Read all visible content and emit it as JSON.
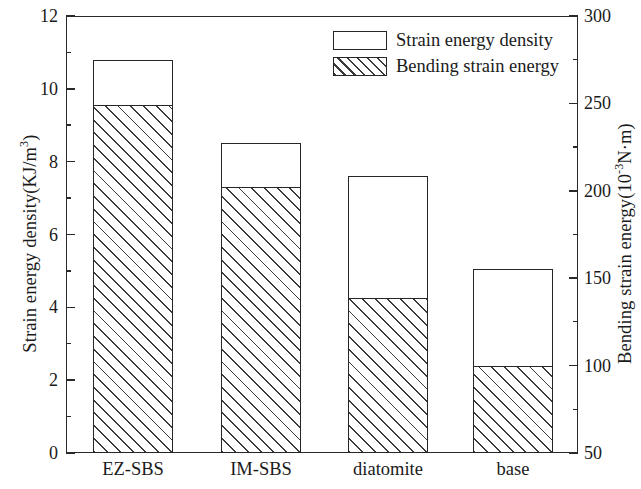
{
  "chart_data": {
    "type": "bar",
    "title": "",
    "subtitle": "",
    "stacked": true,
    "categories": [
      "EZ-SBS",
      "IM-SBS",
      "diatomite",
      "base"
    ],
    "series": [
      {
        "name": "Strain energy density",
        "axis": "left",
        "pattern": "open",
        "values": [
          10.8,
          8.5,
          7.6,
          5.05
        ]
      },
      {
        "name": "Bending strain energy",
        "axis": "right",
        "pattern": "hatched",
        "values": [
          250,
          200,
          135,
          100
        ],
        "values_left_axis_equivalent": [
          9.55,
          7.3,
          4.25,
          2.4
        ]
      }
    ],
    "xlabel": "",
    "ylabel": "Strain energy density(KJ/m3)",
    "ylabel_right": "Bending strain energy(10-3N·m)",
    "ylim": [
      0,
      12
    ],
    "ylim_right": [
      50,
      300
    ],
    "yticks": [
      0,
      2,
      4,
      6,
      8,
      10,
      12
    ],
    "yticks_minor": [
      1,
      3,
      5,
      7,
      9,
      11
    ],
    "yticks_right": [
      50,
      100,
      150,
      200,
      250,
      300
    ],
    "yticks_right_minor": [
      75,
      125,
      175,
      225,
      275
    ],
    "grid": false,
    "legend_position": "top-right-inside"
  },
  "axes": {
    "left": {
      "title_main": "Strain energy density(KJ/m",
      "title_sup": "3",
      "title_tail": ")",
      "ticks": [
        {
          "label": "12",
          "value": 12
        },
        {
          "label": "10",
          "value": 10
        },
        {
          "label": "8",
          "value": 8
        },
        {
          "label": "6",
          "value": 6
        },
        {
          "label": "4",
          "value": 4
        },
        {
          "label": "2",
          "value": 2
        },
        {
          "label": "0",
          "value": 0
        }
      ]
    },
    "right": {
      "title_main": "Bending strain energy(10",
      "title_sup": "-3",
      "title_tail": "N·m)",
      "ticks": [
        {
          "label": "300",
          "value": 300
        },
        {
          "label": "250",
          "value": 250
        },
        {
          "label": "200",
          "value": 200
        },
        {
          "label": "150",
          "value": 150
        },
        {
          "label": "100",
          "value": 100
        },
        {
          "label": "50",
          "value": 50
        }
      ]
    }
  },
  "legend": {
    "items": [
      {
        "label": "Strain energy density",
        "pattern": "open"
      },
      {
        "label": "Bending strain energy",
        "pattern": "hatched"
      }
    ]
  },
  "colors": {
    "axis": "#2a2a2a",
    "bar_outline": "#262626",
    "hatch": "#3a3a3a",
    "background": "#ffffff",
    "text": "#1a1a1a"
  }
}
